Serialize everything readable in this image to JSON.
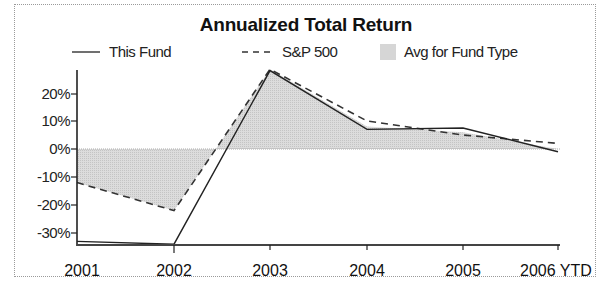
{
  "chart_data": {
    "type": "line",
    "title": "Annualized Total Return",
    "xlabel": "",
    "ylabel": "",
    "categories": [
      "2001",
      "2002",
      "2003",
      "2004",
      "2005",
      "2006 YTD"
    ],
    "series": [
      {
        "name": "This Fund",
        "style": "solid",
        "values": [
          -33,
          -34,
          28,
          7,
          7.5,
          -1
        ]
      },
      {
        "name": "S&P 500",
        "style": "dashed",
        "values": [
          -12,
          -22,
          28.5,
          10,
          5,
          2
        ]
      },
      {
        "name": "Avg for Fund Type",
        "style": "shaded-area",
        "values": [
          -12,
          -22,
          28.5,
          8,
          6,
          0
        ]
      }
    ],
    "yticks": [
      "20%",
      "10%",
      "0%",
      "-10%",
      "-20%",
      "-30%"
    ],
    "ylim": [
      -35,
      32
    ],
    "grid": false,
    "legend_position": "top"
  },
  "legend": {
    "this_fund": "This Fund",
    "sp500": "S&P 500",
    "avg": "Avg for Fund Type"
  },
  "colors": {
    "line": "#222222",
    "area": "#d6d6d6",
    "frame": "#9a9a9a"
  }
}
